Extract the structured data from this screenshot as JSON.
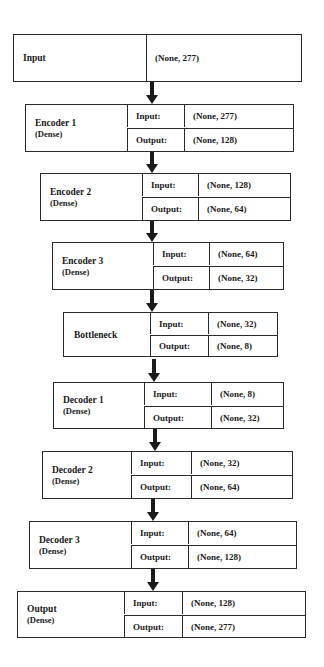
{
  "diagram": {
    "type": "autoencoder-architecture",
    "input_layer": {
      "name": "Input",
      "shape": "(None, 277)"
    },
    "io_labels": {
      "input": "Input:",
      "output": "Output:"
    },
    "layers": [
      {
        "name": "Encoder 1",
        "subtype": "(Dense)",
        "input": "(None, 277)",
        "output": "(None, 128)"
      },
      {
        "name": "Encoder 2",
        "subtype": "(Dense)",
        "input": "(None, 128)",
        "output": "(None, 64)"
      },
      {
        "name": "Encoder 3",
        "subtype": "(Dense)",
        "input": "(None, 64)",
        "output": "(None, 32)"
      },
      {
        "name": "Bottleneck",
        "subtype": "",
        "input": "(None, 32)",
        "output": "(None, 8)"
      },
      {
        "name": "Decoder 1",
        "subtype": "(Dense)",
        "input": "(None, 8)",
        "output": "(None, 32)"
      },
      {
        "name": "Decoder 2",
        "subtype": "(Dense)",
        "input": "(None, 32)",
        "output": "(None, 64)"
      },
      {
        "name": "Decoder 3",
        "subtype": "(Dense)",
        "input": "(None, 64)",
        "output": "(None, 128)"
      },
      {
        "name": "Output",
        "subtype": "(Dense)",
        "input": "(None, 128)",
        "output": "(None, 277)"
      }
    ],
    "colors": {
      "line": "#2a2a2a",
      "text": "#1a1a1a",
      "background": "#ffffff"
    }
  }
}
